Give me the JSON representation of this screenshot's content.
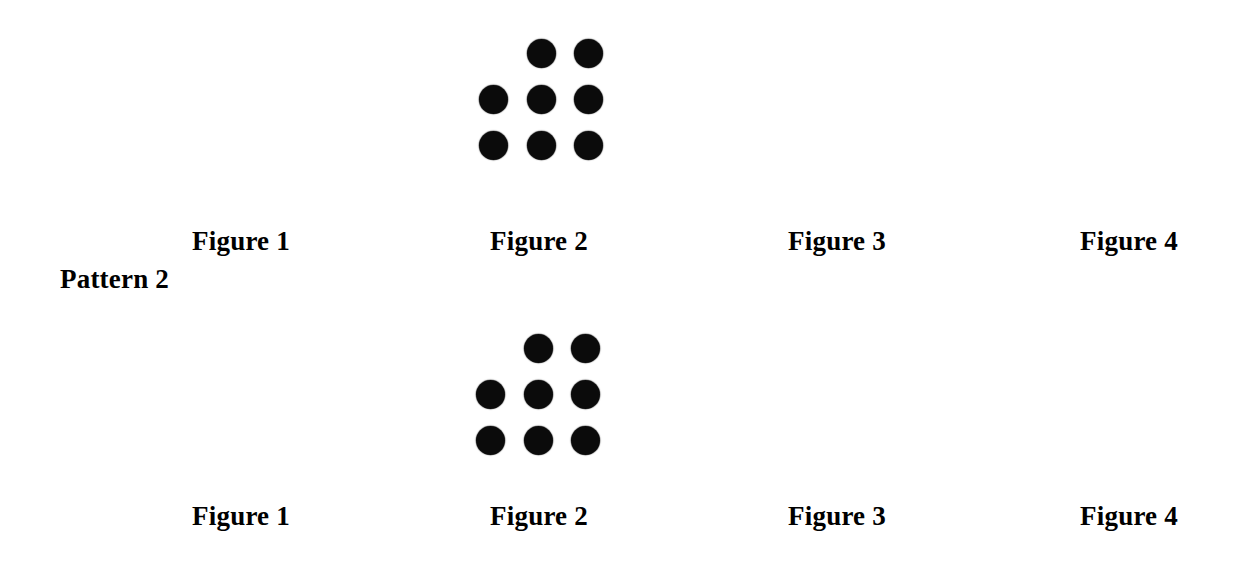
{
  "document": {
    "background_color": "#ffffff",
    "ink_color": "#0b0b0b"
  },
  "patterns": [
    {
      "id": "pattern-row-1",
      "pattern_label": null,
      "figures": [
        {
          "name": "Figure 1",
          "dot_count": 0,
          "rows": []
        },
        {
          "name": "Figure 2",
          "dot_count": 8,
          "rows": [
            {
              "slots": [
                false,
                true,
                true
              ]
            },
            {
              "slots": [
                true,
                true,
                true
              ]
            },
            {
              "slots": [
                true,
                true,
                true
              ]
            }
          ]
        },
        {
          "name": "Figure 3",
          "dot_count": 0,
          "rows": []
        },
        {
          "name": "Figure 4",
          "dot_count": 0,
          "rows": []
        }
      ]
    },
    {
      "id": "pattern-row-2",
      "pattern_label": "Pattern 2",
      "figures": [
        {
          "name": "Figure 1",
          "dot_count": 0,
          "rows": []
        },
        {
          "name": "Figure 2",
          "dot_count": 8,
          "rows": [
            {
              "slots": [
                false,
                true,
                true
              ]
            },
            {
              "slots": [
                true,
                true,
                true
              ]
            },
            {
              "slots": [
                true,
                true,
                true
              ]
            }
          ]
        },
        {
          "name": "Figure 3",
          "dot_count": 0,
          "rows": []
        },
        {
          "name": "Figure 4",
          "dot_count": 0,
          "rows": []
        }
      ]
    }
  ],
  "labels": {
    "pattern_2": "Pattern 2",
    "row1": {
      "figure_1": "Figure 1",
      "figure_2": "Figure 2",
      "figure_3": "Figure 3",
      "figure_4": "Figure 4"
    },
    "row2": {
      "figure_1": "Figure 1",
      "figure_2": "Figure 2",
      "figure_3": "Figure 3",
      "figure_4": "Figure 4"
    }
  }
}
